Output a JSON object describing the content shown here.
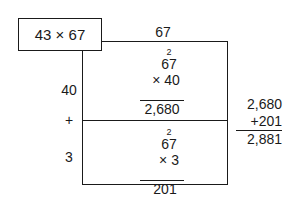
{
  "problem": {
    "label": "43 × 67"
  },
  "column_header": "67",
  "row_labels": {
    "top": "40",
    "operator": "+",
    "bottom": "3"
  },
  "partial_products": [
    {
      "carry": "2",
      "multiplicand": "67",
      "multiplier": "× 40",
      "result": "2,680"
    },
    {
      "carry": "2",
      "multiplicand": "67",
      "multiplier": "× 3",
      "result": "201"
    }
  ],
  "sum": {
    "addend1": "2,680",
    "addend2": "+201",
    "total": "2,881"
  },
  "colors": {
    "line": "#1a1a1a",
    "background": "#ffffff"
  }
}
